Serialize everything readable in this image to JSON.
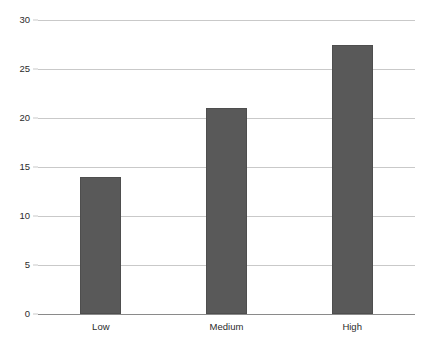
{
  "chart_data": {
    "type": "bar",
    "title": "",
    "subtitle": "",
    "xlabel": "",
    "ylabel": "",
    "categories": [
      "Low",
      "Medium",
      "High"
    ],
    "values": [
      14,
      21,
      27.5
    ],
    "series": [
      {
        "name": "",
        "values": [
          14,
          21,
          27.5
        ]
      }
    ],
    "ylim": [
      0,
      30
    ],
    "yticks": [
      0,
      5,
      10,
      15,
      20,
      25,
      30
    ],
    "ytick_labels": [
      "0",
      "5",
      "10",
      "15",
      "20",
      "25",
      "30"
    ],
    "xtick_labels": [
      "Low",
      "Medium",
      "High"
    ],
    "grid": true,
    "grid_axis": "y",
    "legend": false,
    "legend_position": "none",
    "annotations": [],
    "colors": {
      "bar_fill": "#595959",
      "bar_edge": "#4e4e4e",
      "gridline": "#c9c9c9",
      "axis": "#8a8a8a",
      "text": "#2b2b2b",
      "background": "#ffffff"
    },
    "bar_width_ratio": 0.33
  }
}
